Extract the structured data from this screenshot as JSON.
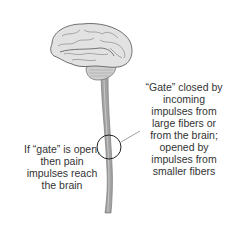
{
  "diagram": {
    "type": "gate-control-theory-of-pain",
    "right_label": {
      "lines": [
        "“Gate” closed by",
        "incoming",
        "impulses from",
        "large fibers or",
        "from the brain;",
        "opened by",
        "impulses from",
        "smaller fibers"
      ]
    },
    "left_label": {
      "lines": [
        "If “gate” is open,",
        "then pain",
        "impulses reach",
        "the brain"
      ]
    },
    "colors": {
      "text": "#333333",
      "brain_fill": "#dcdcdc",
      "brain_stroke": "#6e6e6e",
      "spinal_cord": "#9a9a9a",
      "gate_circle": "#222222"
    }
  }
}
